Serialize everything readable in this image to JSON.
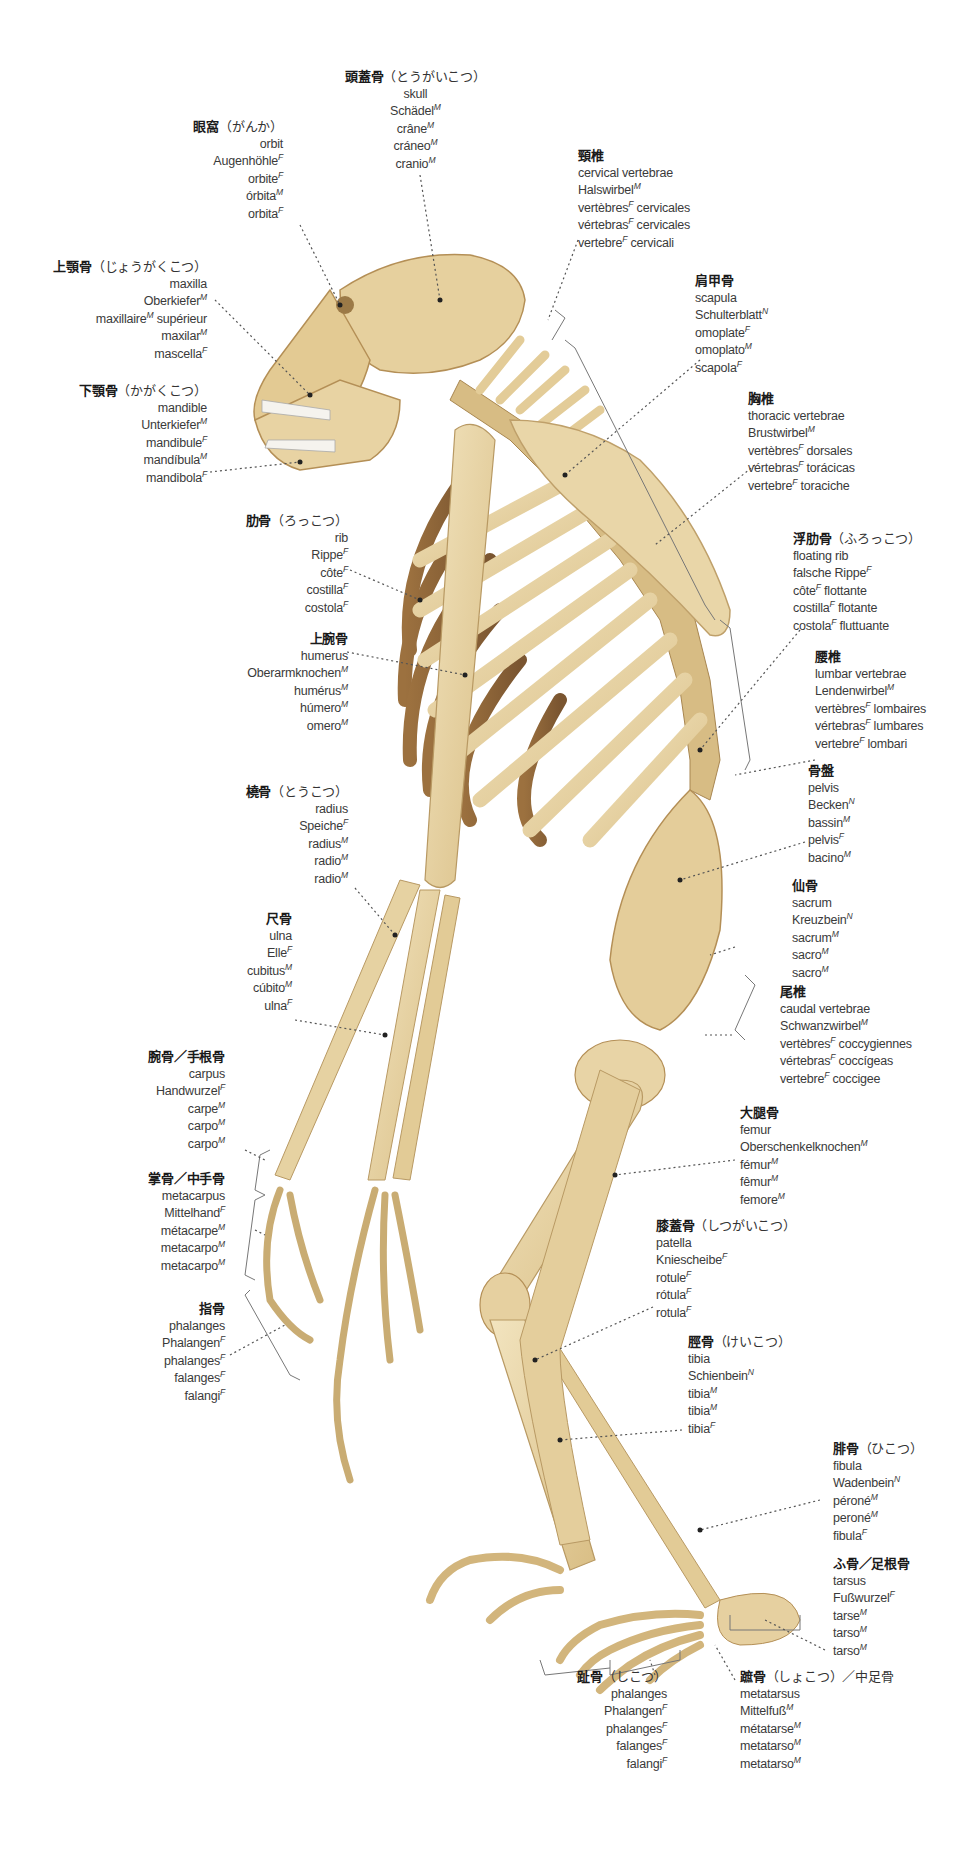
{
  "figure": {
    "colors": {
      "bone": "#E8D4A6",
      "bone_shadow": "#B8925A",
      "bone_dark": "#8A6235",
      "label_text": "#3a3a3a",
      "leader_line": "#555555"
    }
  },
  "labels": [
    {
      "id": "skull",
      "ja": "頭蓋骨",
      "kana": "（とうがいこつ）",
      "terms": [
        {
          "w": "skull",
          "g": ""
        },
        {
          "w": "Schädel",
          "g": "M"
        },
        {
          "w": "crâne",
          "g": "M"
        },
        {
          "w": "cráneo",
          "g": "M"
        },
        {
          "w": "cranio",
          "g": "M"
        }
      ]
    },
    {
      "id": "orbit",
      "ja": "眼窩",
      "kana": "（がんか）",
      "terms": [
        {
          "w": "orbit",
          "g": ""
        },
        {
          "w": "Augenhöhle",
          "g": "F"
        },
        {
          "w": "orbite",
          "g": "F"
        },
        {
          "w": "órbita",
          "g": "M"
        },
        {
          "w": "orbita",
          "g": "F"
        }
      ]
    },
    {
      "id": "maxilla",
      "ja": "上顎骨",
      "kana": "（じょうがくこつ）",
      "terms": [
        {
          "w": "maxilla",
          "g": ""
        },
        {
          "w": "Oberkiefer",
          "g": "M"
        },
        {
          "w": "maxillaire",
          "g": "M",
          "suffix": " supérieur"
        },
        {
          "w": "maxilar",
          "g": "M"
        },
        {
          "w": "mascella",
          "g": "F"
        }
      ]
    },
    {
      "id": "mandible",
      "ja": "下顎骨",
      "kana": "（かがくこつ）",
      "terms": [
        {
          "w": "mandible",
          "g": ""
        },
        {
          "w": "Unterkiefer",
          "g": "M"
        },
        {
          "w": "mandibule",
          "g": "F"
        },
        {
          "w": "mandíbula",
          "g": "M"
        },
        {
          "w": "mandibola",
          "g": "F"
        }
      ]
    },
    {
      "id": "cervical",
      "ja": "頸椎",
      "kana": "",
      "terms": [
        {
          "w": "cervical vertebrae",
          "g": ""
        },
        {
          "w": "Halswirbel",
          "g": "M"
        },
        {
          "w": "vertèbres",
          "g": "F",
          "suffix": " cervicales"
        },
        {
          "w": "vértebras",
          "g": "F",
          "suffix": " cervicales"
        },
        {
          "w": "vertebre",
          "g": "F",
          "suffix": " cervicali"
        }
      ]
    },
    {
      "id": "scapula",
      "ja": "肩甲骨",
      "kana": "",
      "terms": [
        {
          "w": "scapula",
          "g": ""
        },
        {
          "w": "Schulterblatt",
          "g": "N"
        },
        {
          "w": "omoplate",
          "g": "F"
        },
        {
          "w": "omoplato",
          "g": "M"
        },
        {
          "w": "scapola",
          "g": "F"
        }
      ]
    },
    {
      "id": "thoracic",
      "ja": "胸椎",
      "kana": "",
      "terms": [
        {
          "w": "thoracic vertebrae",
          "g": ""
        },
        {
          "w": "Brustwirbel",
          "g": "M"
        },
        {
          "w": "vertèbres",
          "g": "F",
          "suffix": " dorsales"
        },
        {
          "w": "vértebras",
          "g": "F",
          "suffix": " torácicas"
        },
        {
          "w": "vertebre",
          "g": "F",
          "suffix": " toraciche"
        }
      ]
    },
    {
      "id": "rib",
      "ja": "肋骨",
      "kana": "（ろっこつ）",
      "terms": [
        {
          "w": "rib",
          "g": ""
        },
        {
          "w": "Rippe",
          "g": "F"
        },
        {
          "w": "côte",
          "g": "F"
        },
        {
          "w": "costilla",
          "g": "F"
        },
        {
          "w": "costola",
          "g": "F"
        }
      ]
    },
    {
      "id": "floating_rib",
      "ja": "浮肋骨",
      "kana": "（ふろっこつ）",
      "terms": [
        {
          "w": "floating rib",
          "g": ""
        },
        {
          "w": "falsche Rippe",
          "g": "F"
        },
        {
          "w": "côte",
          "g": "F",
          "suffix": " flottante"
        },
        {
          "w": "costilla",
          "g": "F",
          "suffix": " flotante"
        },
        {
          "w": "costola",
          "g": "F",
          "suffix": " fluttuante"
        }
      ]
    },
    {
      "id": "humerus",
      "ja": "上腕骨",
      "kana": "",
      "terms": [
        {
          "w": "humerus",
          "g": ""
        },
        {
          "w": "Oberarmknochen",
          "g": "M"
        },
        {
          "w": "humérus",
          "g": "M"
        },
        {
          "w": "húmero",
          "g": "M"
        },
        {
          "w": "omero",
          "g": "M"
        }
      ]
    },
    {
      "id": "lumbar",
      "ja": "腰椎",
      "kana": "",
      "terms": [
        {
          "w": "lumbar vertebrae",
          "g": ""
        },
        {
          "w": "Lendenwirbel",
          "g": "M"
        },
        {
          "w": "vertèbres",
          "g": "F",
          "suffix": " lombaires"
        },
        {
          "w": "vértebras",
          "g": "F",
          "suffix": " lumbares"
        },
        {
          "w": "vertebre",
          "g": "F",
          "suffix": " lombari"
        }
      ]
    },
    {
      "id": "radius",
      "ja": "橈骨",
      "kana": "（とうこつ）",
      "terms": [
        {
          "w": "radius",
          "g": ""
        },
        {
          "w": "Speiche",
          "g": "F"
        },
        {
          "w": "radius",
          "g": "M"
        },
        {
          "w": "radio",
          "g": "M"
        },
        {
          "w": "radio",
          "g": "M"
        }
      ]
    },
    {
      "id": "pelvis",
      "ja": "骨盤",
      "kana": "",
      "terms": [
        {
          "w": "pelvis",
          "g": ""
        },
        {
          "w": "Becken",
          "g": "N"
        },
        {
          "w": "bassin",
          "g": "M"
        },
        {
          "w": "pelvis",
          "g": "F"
        },
        {
          "w": "bacino",
          "g": "M"
        }
      ]
    },
    {
      "id": "sacrum",
      "ja": "仙骨",
      "kana": "",
      "terms": [
        {
          "w": "sacrum",
          "g": ""
        },
        {
          "w": "Kreuzbein",
          "g": "N"
        },
        {
          "w": "sacrum",
          "g": "M"
        },
        {
          "w": "sacro",
          "g": "M"
        },
        {
          "w": "sacro",
          "g": "M"
        }
      ]
    },
    {
      "id": "ulna",
      "ja": "尺骨",
      "kana": "",
      "terms": [
        {
          "w": "ulna",
          "g": ""
        },
        {
          "w": "Elle",
          "g": "F"
        },
        {
          "w": "cubitus",
          "g": "M"
        },
        {
          "w": "cúbito",
          "g": "M"
        },
        {
          "w": "ulna",
          "g": "F"
        }
      ]
    },
    {
      "id": "caudal",
      "ja": "尾椎",
      "kana": "",
      "terms": [
        {
          "w": "caudal vertebrae",
          "g": ""
        },
        {
          "w": "Schwanzwirbel",
          "g": "M"
        },
        {
          "w": "vertèbres",
          "g": "F",
          "suffix": " coccygiennes"
        },
        {
          "w": "vértebras",
          "g": "F",
          "suffix": " coccígeas"
        },
        {
          "w": "vertebre",
          "g": "F",
          "suffix": " coccigee"
        }
      ]
    },
    {
      "id": "carpus",
      "ja": "腕骨／手根骨",
      "kana": "",
      "terms": [
        {
          "w": "carpus",
          "g": ""
        },
        {
          "w": "Handwurzel",
          "g": "F"
        },
        {
          "w": "carpe",
          "g": "M"
        },
        {
          "w": "carpo",
          "g": "M"
        },
        {
          "w": "carpo",
          "g": "M"
        }
      ]
    },
    {
      "id": "femur",
      "ja": "大腿骨",
      "kana": "",
      "terms": [
        {
          "w": "femur",
          "g": ""
        },
        {
          "w": "Oberschenkelknochen",
          "g": "M"
        },
        {
          "w": "fémur",
          "g": "M"
        },
        {
          "w": "fêmur",
          "g": "M"
        },
        {
          "w": "femore",
          "g": "M"
        }
      ]
    },
    {
      "id": "metacarpus",
      "ja": "掌骨／中手骨",
      "kana": "",
      "terms": [
        {
          "w": "metacarpus",
          "g": ""
        },
        {
          "w": "Mittelhand",
          "g": "F"
        },
        {
          "w": "métacarpe",
          "g": "M"
        },
        {
          "w": "metacarpo",
          "g": "M"
        },
        {
          "w": "metacarpo",
          "g": "M"
        }
      ]
    },
    {
      "id": "patella",
      "ja": "膝蓋骨",
      "kana": "（しつがいこつ）",
      "terms": [
        {
          "w": "patella",
          "g": ""
        },
        {
          "w": "Kniescheibe",
          "g": "F"
        },
        {
          "w": "rotule",
          "g": "F"
        },
        {
          "w": "rótula",
          "g": "F"
        },
        {
          "w": "rotula",
          "g": "F"
        }
      ]
    },
    {
      "id": "hand_phalanges",
      "ja": "指骨",
      "kana": "",
      "terms": [
        {
          "w": "phalanges",
          "g": ""
        },
        {
          "w": "Phalangen",
          "g": "F"
        },
        {
          "w": "phalanges",
          "g": "F"
        },
        {
          "w": "falanges",
          "g": "F"
        },
        {
          "w": "falangi",
          "g": "F"
        }
      ]
    },
    {
      "id": "tibia",
      "ja": "脛骨",
      "kana": "（けいこつ）",
      "terms": [
        {
          "w": "tibia",
          "g": ""
        },
        {
          "w": "Schienbein",
          "g": "N"
        },
        {
          "w": "tibia",
          "g": "M"
        },
        {
          "w": "tibia",
          "g": "M"
        },
        {
          "w": "tibia",
          "g": "F"
        }
      ]
    },
    {
      "id": "fibula",
      "ja": "腓骨",
      "kana": "（ひこつ）",
      "terms": [
        {
          "w": "fibula",
          "g": ""
        },
        {
          "w": "Wadenbein",
          "g": "N"
        },
        {
          "w": "péroné",
          "g": "M"
        },
        {
          "w": "peroné",
          "g": "M"
        },
        {
          "w": "fibula",
          "g": "F"
        }
      ]
    },
    {
      "id": "tarsus",
      "ja": "ふ骨／足根骨",
      "kana": "",
      "terms": [
        {
          "w": "tarsus",
          "g": ""
        },
        {
          "w": "Fußwurzel",
          "g": "F"
        },
        {
          "w": "tarse",
          "g": "M"
        },
        {
          "w": "tarso",
          "g": "M"
        },
        {
          "w": "tarso",
          "g": "M"
        }
      ]
    },
    {
      "id": "foot_phalanges",
      "ja": "趾骨",
      "kana": "（しこつ）",
      "terms": [
        {
          "w": "phalanges",
          "g": ""
        },
        {
          "w": "Phalangen",
          "g": "F"
        },
        {
          "w": "phalanges",
          "g": "F"
        },
        {
          "w": "falanges",
          "g": "F"
        },
        {
          "w": "falangi",
          "g": "F"
        }
      ]
    },
    {
      "id": "metatarsus",
      "ja": "蹠骨",
      "kana": "（しょこつ）／中足骨",
      "terms": [
        {
          "w": "metatarsus",
          "g": ""
        },
        {
          "w": "Mittelfuß",
          "g": "M"
        },
        {
          "w": "métatarse",
          "g": "M"
        },
        {
          "w": "metatarso",
          "g": "M"
        },
        {
          "w": "metatarso",
          "g": "M"
        }
      ]
    }
  ]
}
